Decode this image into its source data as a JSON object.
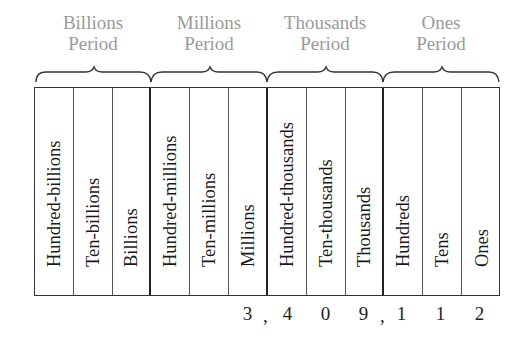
{
  "periods": [
    {
      "line1": "Billions",
      "line2": "Period"
    },
    {
      "line1": "Millions",
      "line2": "Period"
    },
    {
      "line1": "Thousands",
      "line2": "Period"
    },
    {
      "line1": "Ones",
      "line2": "Period"
    }
  ],
  "columns": [
    "Hundred-billions",
    "Ten-billions",
    "Billions",
    "Hundred-millions",
    "Ten-millions",
    "Millions",
    "Hundred-thousands",
    "Ten-thousands",
    "Thousands",
    "Hundreds",
    "Tens",
    "Ones"
  ],
  "number": {
    "digits": [
      "3",
      "4",
      "0",
      "9",
      "1",
      "1",
      "2"
    ],
    "separators": [
      ",",
      ","
    ],
    "full": "3,409,112"
  },
  "colors": {
    "period_label": "#9a9a9a",
    "text": "#1a1a1a",
    "lines": "#333333"
  }
}
